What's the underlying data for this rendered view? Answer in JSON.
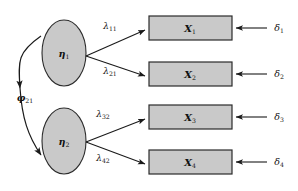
{
  "diagram": {
    "type": "structural-equation-model-path-diagram",
    "colors": {
      "node_fill": "#c9c9c9",
      "node_stroke": "#2b2b2b",
      "line": "#1a1a1a",
      "background": "#ffffff",
      "text": "#111111"
    },
    "latent_variables": [
      {
        "id": "eta1",
        "symbol": "η",
        "subscript": "1"
      },
      {
        "id": "eta2",
        "symbol": "η",
        "subscript": "2"
      }
    ],
    "indicators": [
      {
        "id": "x1",
        "symbol": "X",
        "subscript": "1"
      },
      {
        "id": "x2",
        "symbol": "X",
        "subscript": "2"
      },
      {
        "id": "x3",
        "symbol": "X",
        "subscript": "3"
      },
      {
        "id": "x4",
        "symbol": "X",
        "subscript": "4"
      }
    ],
    "loadings": [
      {
        "id": "lambda11",
        "symbol": "λ",
        "subscript": "11",
        "from": "eta1",
        "to": "x1"
      },
      {
        "id": "lambda21",
        "symbol": "λ",
        "subscript": "21",
        "from": "eta1",
        "to": "x2"
      },
      {
        "id": "lambda32",
        "symbol": "λ",
        "subscript": "32",
        "from": "eta2",
        "to": "x3"
      },
      {
        "id": "lambda42",
        "symbol": "λ",
        "subscript": "42",
        "from": "eta2",
        "to": "x4"
      }
    ],
    "errors": [
      {
        "id": "delta1",
        "symbol": "δ",
        "subscript": "1",
        "to": "x1"
      },
      {
        "id": "delta2",
        "symbol": "δ",
        "subscript": "2",
        "to": "x2"
      },
      {
        "id": "delta3",
        "symbol": "δ",
        "subscript": "3",
        "to": "x3"
      },
      {
        "id": "delta4",
        "symbol": "δ",
        "subscript": "4",
        "to": "x4"
      }
    ],
    "covariance": {
      "id": "phi21",
      "symbol": "φ",
      "subscript": "21",
      "between": [
        "eta1",
        "eta2"
      ],
      "bidirectional": true
    }
  }
}
